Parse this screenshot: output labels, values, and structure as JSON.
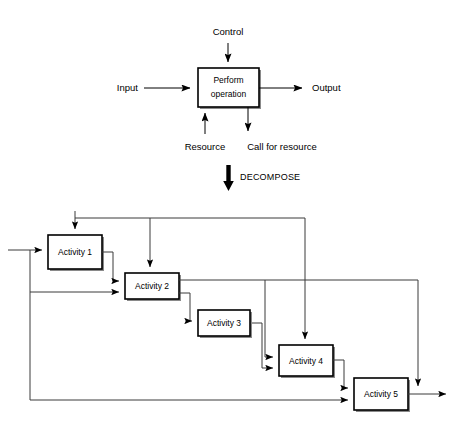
{
  "diagram": {
    "transition_label": "DECOMPOSE",
    "top_model": {
      "process_box": {
        "line1": "Perform",
        "line2": "operation"
      },
      "labels": {
        "input": "Input",
        "control": "Control",
        "output": "Output",
        "resource": "Resource",
        "call_for_resource": "Call for resource"
      }
    },
    "decomposed_model": {
      "activities": [
        {
          "id": "activity-1",
          "label": "Activity 1"
        },
        {
          "id": "activity-2",
          "label": "Activity 2"
        },
        {
          "id": "activity-3",
          "label": "Activity 3"
        },
        {
          "id": "activity-4",
          "label": "Activity 4"
        },
        {
          "id": "activity-5",
          "label": "Activity 5"
        }
      ]
    },
    "colors": {
      "background": "#ffffff",
      "stroke": "#000000",
      "connector": "#3b3b3b",
      "box_shadow": "#8a8a8a",
      "box_fill": "#ffffff"
    }
  }
}
